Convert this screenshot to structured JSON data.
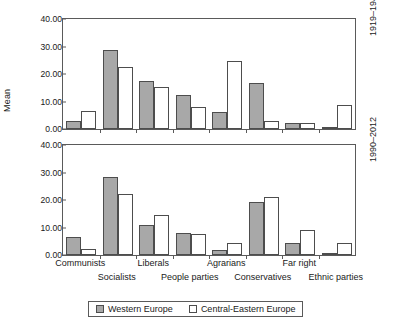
{
  "chart_data": {
    "type": "bar",
    "title": "",
    "xlabel": "",
    "ylabel": "Mean",
    "ylim": [
      0,
      40
    ],
    "yticks": [
      "0.00",
      "10.00",
      "20.00",
      "30.00",
      "40.00"
    ],
    "ytick_values": [
      0,
      10,
      20,
      30,
      40
    ],
    "grid": false,
    "legend_position": "bottom",
    "legend": [
      "Western Europe",
      "Central-Eastern Europe"
    ],
    "categories": [
      "Communists",
      "Socialists",
      "Liberals",
      "People parties",
      "Agrarians",
      "Conservatives",
      "Far right",
      "Ethnic parties"
    ],
    "panels": [
      {
        "label": "1919–1944",
        "series": [
          {
            "name": "Western Europe",
            "values": [
              3.0,
              28.8,
              17.4,
              12.4,
              6.2,
              16.6,
              2.2,
              0.6
            ]
          },
          {
            "name": "Central-Eastern Europe",
            "values": [
              6.5,
              22.4,
              15.2,
              8.0,
              24.6,
              2.8,
              2.1,
              8.8
            ]
          }
        ]
      },
      {
        "label": "1990–2012",
        "series": [
          {
            "name": "Western Europe",
            "values": [
              6.5,
              28.3,
              11.0,
              8.0,
              2.0,
              19.2,
              4.3,
              0.4
            ]
          },
          {
            "name": "Central-Eastern Europe",
            "values": [
              2.3,
              22.3,
              14.5,
              7.5,
              4.5,
              21.2,
              9.0,
              4.3
            ]
          }
        ]
      }
    ],
    "colors": {
      "western_europe": "#a8a8a8",
      "central_eastern_europe": "#ffffff",
      "axis": "#5a5a5a",
      "bar_outline": "#4d4d4d",
      "background": "#ffffff"
    }
  }
}
